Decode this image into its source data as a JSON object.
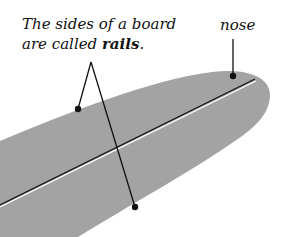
{
  "diagram": {
    "caption": {
      "line1": "The sides of a board",
      "line2_prefix": "are called ",
      "line2_bold": "rails",
      "line2_suffix": "."
    },
    "labels": {
      "nose": "nose"
    },
    "colors": {
      "board_fill": "#a3a3a3",
      "stringer": "#111111",
      "stringer_highlight": "#ffffff",
      "pointer": "#111111",
      "background": "#ffffff"
    },
    "parts": [
      "board",
      "stringer",
      "rail",
      "nose"
    ]
  }
}
